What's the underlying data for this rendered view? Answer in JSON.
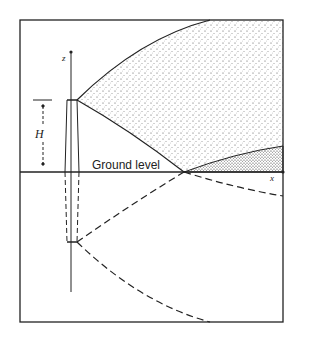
{
  "diagram": {
    "labels": {
      "ground": "Ground level",
      "height": "H",
      "z_axis": "z",
      "x_axis": "x"
    },
    "colors": {
      "line": "#222222",
      "background": "#ffffff"
    },
    "elements": [
      "frame",
      "stack",
      "plume",
      "image-stack",
      "image-plume",
      "ground-line",
      "ground-reflection-shading"
    ]
  }
}
